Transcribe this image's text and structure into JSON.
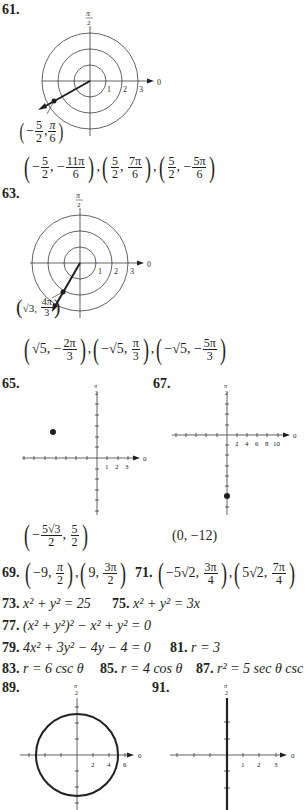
{
  "problems": {
    "p61": {
      "number": "61.",
      "plot": {
        "point_label": [
          "5",
          "2",
          "π",
          "6"
        ],
        "axis_labels": [
          "1",
          "2",
          "3"
        ],
        "zero": "0",
        "pi2": [
          "π",
          "2"
        ]
      },
      "answer": [
        {
          "r_sign": "−",
          "r_num": "5",
          "r_den": "2",
          "t_sign": "−",
          "t_num": "11π",
          "t_den": "6"
        },
        {
          "r_sign": "",
          "r_num": "5",
          "r_den": "2",
          "t_sign": "",
          "t_num": "7π",
          "t_den": "6"
        },
        {
          "r_sign": "",
          "r_num": "5",
          "r_den": "2",
          "t_sign": "−",
          "t_num": "5π",
          "t_den": "6"
        }
      ]
    },
    "p63": {
      "number": "63.",
      "plot": {
        "point_label_r": "√3",
        "point_label_t_num": "4π",
        "point_label_t_den": "3",
        "axis_labels": [
          "1",
          "2",
          "3"
        ],
        "zero": "0",
        "pi2": [
          "π",
          "2"
        ]
      },
      "answer": [
        {
          "r": "√5",
          "t_sign": "−",
          "t_num": "2π",
          "t_den": "3"
        },
        {
          "r": "−√5",
          "t_sign": "",
          "t_num": "π",
          "t_den": "3"
        },
        {
          "r": "−√5",
          "t_sign": "−",
          "t_num": "5π",
          "t_den": "3"
        }
      ]
    },
    "p65": {
      "number": "65.",
      "plot": {
        "axis_labels": [
          "1",
          "2",
          "3"
        ],
        "zero": "0",
        "pi2": [
          "π",
          "2"
        ]
      },
      "answer": {
        "x_sign": "−",
        "x_num": "5√3",
        "x_den": "2",
        "y_num": "5",
        "y_den": "2"
      }
    },
    "p67": {
      "number": "67.",
      "plot": {
        "axis_labels": [
          "2",
          "4",
          "6",
          "8",
          "10"
        ],
        "zero": "0",
        "pi2": [
          "π",
          "2"
        ]
      },
      "answer": "(0, −12)"
    },
    "p69": {
      "number": "69.",
      "a1_r": "−9",
      "a1_t_num": "π",
      "a1_t_den": "2",
      "a2_r": "9",
      "a2_t_num": "3π",
      "a2_t_den": "2"
    },
    "p71": {
      "number": "71.",
      "a1_r": "−5√2",
      "a1_t_num": "3π",
      "a1_t_den": "4",
      "a2_r": "5√2",
      "a2_t_num": "7π",
      "a2_t_den": "4"
    },
    "p73": {
      "number": "73.",
      "equation": "x² + y² = 25"
    },
    "p75": {
      "number": "75.",
      "equation": "x² + y² = 3x"
    },
    "p77": {
      "number": "77.",
      "equation": "(x² + y²)² − x² + y² = 0"
    },
    "p79": {
      "number": "79.",
      "equation": "4x² + 3y² − 4y − 4 = 0"
    },
    "p81": {
      "number": "81.",
      "equation": "r = 3"
    },
    "p83": {
      "number": "83.",
      "equation": "r = 6 csc θ"
    },
    "p85": {
      "number": "85.",
      "equation": "r = 4 cos θ"
    },
    "p87": {
      "number": "87.",
      "equation": "r² = 5 sec θ csc θ"
    },
    "p89": {
      "number": "89.",
      "plot": {
        "axis_labels": [
          "2",
          "4",
          "6"
        ],
        "zero": "0",
        "pi2": [
          "π",
          "2"
        ]
      }
    },
    "p91": {
      "number": "91.",
      "plot": {
        "axis_labels": [
          "1",
          "2",
          "3"
        ],
        "zero": "0",
        "pi2": [
          "π",
          "2"
        ]
      }
    }
  }
}
